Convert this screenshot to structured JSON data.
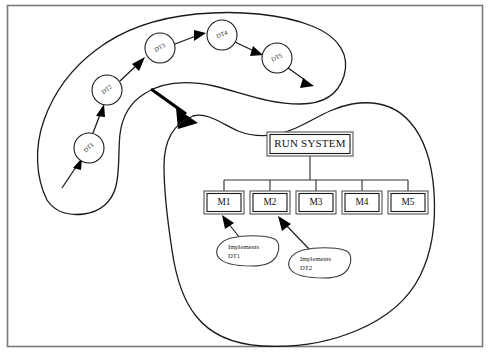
{
  "diagram": {
    "frame": {
      "name": "outer-border"
    },
    "upper_region": {
      "name": "design-technique-cloud",
      "label": "",
      "nodes": [
        {
          "id": "DT1",
          "label": "DT1",
          "cx": 89,
          "cy": 148,
          "r": 15,
          "rotation": -42
        },
        {
          "id": "DT2",
          "label": "DT2",
          "cx": 107,
          "cy": 90,
          "r": 15,
          "rotation": -38
        },
        {
          "id": "DT3",
          "label": "DT3",
          "cx": 160,
          "cy": 48,
          "r": 15,
          "rotation": -30
        },
        {
          "id": "DT4",
          "label": "DT4",
          "cx": 222,
          "cy": 35,
          "r": 15,
          "rotation": -22
        },
        {
          "id": "DT5",
          "label": "DT5",
          "cx": 277,
          "cy": 58,
          "r": 15,
          "rotation": -26
        }
      ],
      "flow": [
        {
          "from": "start",
          "to": "DT1"
        },
        {
          "from": "DT1",
          "to": "DT2"
        },
        {
          "from": "DT2",
          "to": "DT3"
        },
        {
          "from": "DT3",
          "to": "DT4"
        },
        {
          "from": "DT4",
          "to": "DT5"
        },
        {
          "from": "DT5",
          "to": "end"
        }
      ]
    },
    "transition_arrow": {
      "name": "transition-arrow",
      "label": "",
      "from": {
        "x": 151,
        "y": 89
      },
      "to": {
        "x": 196,
        "y": 122
      }
    },
    "lower_region": {
      "name": "implementation-cloud",
      "label": "",
      "root": {
        "id": "RUN_SYSTEM",
        "label": "RUN SYSTEM",
        "x": 268,
        "y": 133,
        "w": 84,
        "h": 22
      },
      "modules": [
        {
          "id": "M1",
          "label": "M1",
          "x": 205,
          "y": 192,
          "w": 38,
          "h": 21
        },
        {
          "id": "M2",
          "label": "M2",
          "x": 251,
          "y": 192,
          "w": 38,
          "h": 21
        },
        {
          "id": "M3",
          "label": "M3",
          "x": 297,
          "y": 192,
          "w": 38,
          "h": 21
        },
        {
          "id": "M4",
          "label": "M4",
          "x": 343,
          "y": 192,
          "w": 38,
          "h": 21
        },
        {
          "id": "M5",
          "label": "M5",
          "x": 389,
          "y": 192,
          "w": 38,
          "h": 21
        }
      ],
      "annotations": [
        {
          "id": "impl-dt1",
          "line1": "Implements",
          "line2": "DT1",
          "cx": 246,
          "cy": 252,
          "rx": 30,
          "ry": 14,
          "target": "M1"
        },
        {
          "id": "impl-dt2",
          "line1": "Implements",
          "line2": "DT2",
          "cx": 318,
          "cy": 264,
          "rx": 30,
          "ry": 14,
          "target": "M2"
        }
      ]
    },
    "colors": {
      "frame_stroke": "#7a7a7a",
      "ink": "#1a1a1a",
      "background": "#ffffff",
      "arrow_fill": "#000000",
      "box_stroke": "#555555"
    }
  }
}
